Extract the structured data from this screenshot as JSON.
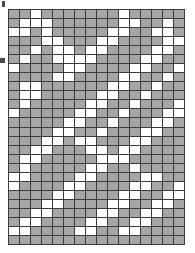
{
  "page": {
    "background_color": "#ffffff"
  },
  "marks": {
    "top_left_label": "top-left-registration-mark",
    "mid_left_label": "mid-left-row-marker"
  },
  "chart": {
    "label": "pattern-chart",
    "columns": 16,
    "rows": 26,
    "filled_color": "#a6a6a6",
    "empty_color": "#ffffff",
    "grid_line_color": "#3b3b3b",
    "legend": {
      "filled_meaning": "filled-cell",
      "empty_meaning": "empty-cell"
    },
    "cells": [
      [
        1,
        1,
        0,
        1,
        1,
        1,
        1,
        1,
        1,
        1,
        0,
        1,
        1,
        1,
        1,
        1
      ],
      [
        1,
        0,
        0,
        0,
        1,
        1,
        1,
        1,
        1,
        1,
        0,
        0,
        1,
        1,
        0,
        1
      ],
      [
        0,
        0,
        1,
        0,
        1,
        1,
        1,
        1,
        1,
        0,
        0,
        1,
        1,
        0,
        0,
        1
      ],
      [
        1,
        1,
        1,
        0,
        0,
        1,
        1,
        1,
        0,
        0,
        1,
        1,
        1,
        1,
        0,
        0
      ],
      [
        1,
        1,
        0,
        1,
        0,
        0,
        1,
        0,
        0,
        1,
        1,
        1,
        1,
        0,
        0,
        1
      ],
      [
        1,
        0,
        1,
        1,
        0,
        0,
        0,
        0,
        1,
        1,
        1,
        1,
        0,
        0,
        1,
        1
      ],
      [
        0,
        1,
        1,
        1,
        1,
        0,
        0,
        1,
        1,
        1,
        1,
        0,
        0,
        1,
        1,
        0
      ],
      [
        1,
        1,
        1,
        1,
        0,
        0,
        1,
        1,
        1,
        1,
        0,
        0,
        1,
        1,
        0,
        1
      ],
      [
        1,
        0,
        0,
        1,
        1,
        1,
        1,
        1,
        1,
        0,
        0,
        1,
        1,
        0,
        1,
        1
      ],
      [
        1,
        0,
        0,
        1,
        1,
        1,
        1,
        1,
        0,
        0,
        1,
        1,
        0,
        1,
        1,
        1
      ],
      [
        1,
        0,
        1,
        1,
        1,
        1,
        1,
        0,
        0,
        1,
        1,
        0,
        1,
        1,
        1,
        0
      ],
      [
        0,
        1,
        1,
        1,
        1,
        1,
        0,
        0,
        1,
        1,
        0,
        1,
        1,
        1,
        0,
        0
      ],
      [
        1,
        1,
        1,
        1,
        1,
        0,
        0,
        1,
        1,
        0,
        1,
        1,
        1,
        0,
        0,
        1
      ],
      [
        1,
        1,
        1,
        1,
        0,
        0,
        1,
        1,
        0,
        1,
        1,
        1,
        0,
        0,
        1,
        1
      ],
      [
        1,
        1,
        1,
        0,
        0,
        1,
        0,
        0,
        1,
        1,
        1,
        0,
        0,
        1,
        1,
        1
      ],
      [
        1,
        1,
        0,
        0,
        1,
        1,
        1,
        0,
        0,
        1,
        0,
        0,
        1,
        1,
        1,
        1
      ],
      [
        1,
        0,
        0,
        1,
        1,
        1,
        1,
        1,
        0,
        0,
        0,
        1,
        1,
        1,
        1,
        1
      ],
      [
        1,
        0,
        1,
        1,
        1,
        1,
        1,
        0,
        0,
        1,
        1,
        0,
        1,
        1,
        1,
        1
      ],
      [
        0,
        0,
        1,
        1,
        1,
        1,
        0,
        0,
        1,
        1,
        1,
        1,
        0,
        0,
        1,
        1
      ],
      [
        0,
        1,
        1,
        1,
        1,
        0,
        0,
        1,
        1,
        1,
        1,
        0,
        0,
        1,
        1,
        0
      ],
      [
        1,
        1,
        1,
        1,
        0,
        0,
        1,
        1,
        1,
        1,
        0,
        0,
        1,
        1,
        0,
        0
      ],
      [
        1,
        1,
        1,
        0,
        0,
        1,
        1,
        1,
        1,
        0,
        0,
        1,
        1,
        0,
        0,
        1
      ],
      [
        1,
        1,
        0,
        0,
        1,
        1,
        1,
        1,
        0,
        0,
        1,
        1,
        0,
        0,
        1,
        1
      ],
      [
        1,
        0,
        0,
        1,
        1,
        1,
        1,
        0,
        0,
        1,
        1,
        0,
        0,
        1,
        1,
        1
      ],
      [
        0,
        0,
        1,
        1,
        1,
        1,
        0,
        0,
        1,
        1,
        0,
        0,
        1,
        1,
        1,
        1
      ],
      [
        1,
        1,
        1,
        1,
        1,
        1,
        1,
        1,
        1,
        1,
        1,
        1,
        1,
        1,
        1,
        1
      ]
    ]
  }
}
